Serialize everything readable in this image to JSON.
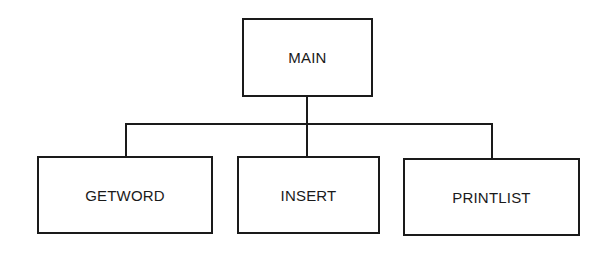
{
  "diagram": {
    "type": "hierarchy-chart",
    "root": {
      "label": "MAIN"
    },
    "children": [
      {
        "label": "GETWORD"
      },
      {
        "label": "INSERT"
      },
      {
        "label": "PRINTLIST"
      }
    ],
    "colors": {
      "stroke": "#1a1a1a",
      "background": "#ffffff",
      "text": "#1a1a1a"
    }
  }
}
